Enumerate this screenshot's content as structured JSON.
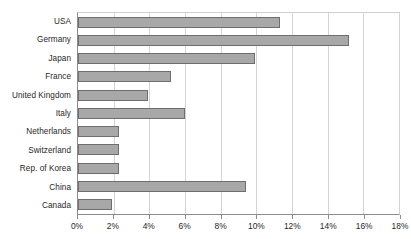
{
  "chart_data": {
    "type": "bar",
    "orientation": "horizontal",
    "title": "",
    "subtitle": "",
    "xlabel": "",
    "ylabel": "",
    "xlim": [
      0,
      18
    ],
    "ylim": null,
    "grid": true,
    "legend": null,
    "legend_position": "none",
    "tick_suffix": "%",
    "xticks": [
      0,
      2,
      4,
      6,
      8,
      10,
      12,
      14,
      16,
      18
    ],
    "xtick_labels": [
      "0%",
      "2%",
      "4%",
      "6%",
      "8%",
      "10%",
      "12%",
      "14%",
      "16%",
      "18%"
    ],
    "categories": [
      "USA",
      "Germany",
      "Japan",
      "France",
      "United Kingdom",
      "Italy",
      "Netherlands",
      "Switzerland",
      "Rep. of Korea",
      "China",
      "Canada"
    ],
    "values": [
      11.3,
      15.2,
      9.9,
      5.2,
      3.9,
      6.0,
      2.3,
      2.3,
      2.3,
      9.4,
      1.9
    ],
    "value_labels": [
      "11.3%",
      "15.2%",
      "9.9%",
      "5.2%",
      "3.9%",
      "6.0%",
      "2.3%",
      "2.3%",
      "2.3%",
      "9.4%",
      "1.9%"
    ],
    "colors": {
      "bar_fill": "#a8a8a8",
      "bar_border": "#6e6e6e",
      "gridline": "#d4d4d4",
      "axis": "#8c8c8c",
      "plot_background": "#ffffff",
      "text": "#1f1f1f"
    }
  }
}
